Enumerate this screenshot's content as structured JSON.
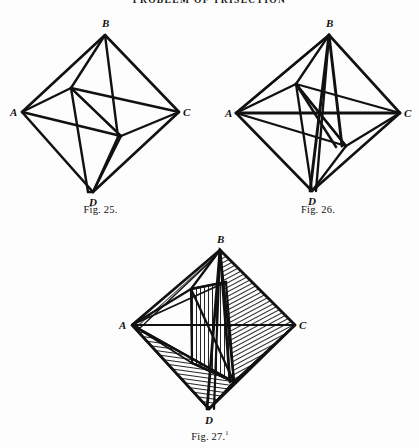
{
  "header": {
    "text": "PROBLEM OF TRISECTION"
  },
  "colors": {
    "ink": "#111111",
    "paper": "#fdfdfd",
    "hatch": "#1a1a1a"
  },
  "figures": [
    {
      "id": "figure-25",
      "caption": "Fig. 25.",
      "caption_note": "",
      "vertices": {
        "A": "A",
        "B": "B",
        "C": "C",
        "D": "D"
      },
      "description": "Rhombus ABCD with an inscribed parallelogram formed by four internal chords.",
      "shaded": false
    },
    {
      "id": "figure-26",
      "caption": "Fig. 26.",
      "caption_note": "",
      "vertices": {
        "A": "A",
        "B": "B",
        "C": "C",
        "D": "D"
      },
      "description": "Rhombus ABCD with inscribed parallelogram plus horizontal diagonal AC and additional chords from A, B, C and D crossing near the centre.",
      "shaded": false
    },
    {
      "id": "figure-27",
      "caption": "Fig. 27.",
      "caption_note": "1",
      "vertices": {
        "A": "A",
        "B": "B",
        "C": "C",
        "D": "D"
      },
      "description": "Rhombus ABCD with several regions filled by line hatching: diagonal hatching at upper right, vertical hatching in the central quadrilateral, and near-horizontal hatching in the lower-left triangle towards D.",
      "shaded": true
    }
  ]
}
